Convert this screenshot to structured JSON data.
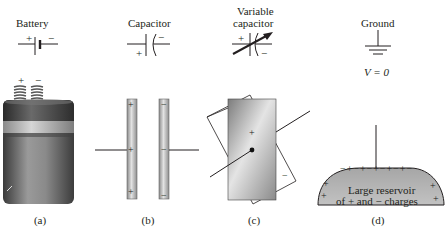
{
  "panels": [
    {
      "id": "a",
      "title": "Battery",
      "symbol_plus": "+",
      "symbol_minus": "−",
      "terminal_plus": "+",
      "terminal_minus": "−",
      "caption": "(a)"
    },
    {
      "id": "b",
      "title": "Capacitor",
      "symbol_plus": "+",
      "symbol_minus": "−",
      "plate_left_charges": [
        "+",
        "+",
        "+"
      ],
      "plate_right_charges": [
        "−",
        "−",
        "−"
      ],
      "caption": "(b)"
    },
    {
      "id": "c",
      "title_line1": "Variable",
      "title_line2": "capacitor",
      "symbol_plus": "+",
      "symbol_minus": "−",
      "plate_front_charge": "+",
      "plate_back_charge": "−",
      "caption": "(c)"
    },
    {
      "id": "d",
      "title": "Ground",
      "equation": "V = 0",
      "reservoir_line1": "Large reservoir",
      "reservoir_line2": "of + and − charges",
      "reservoir_edge_charges": "−+−+−+−+−+−",
      "caption": "(d)"
    }
  ],
  "colors": {
    "line": "#231f20",
    "metal_light": "#e6e6e6",
    "metal_dark": "#7a7a7a",
    "reservoir": "#b8b8b8"
  }
}
